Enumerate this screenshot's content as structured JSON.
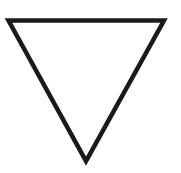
{
  "figure": {
    "shape": "inverted-triangle",
    "fill": "none",
    "stroke_color": "#1a1a1a",
    "stroke_width": 4.5,
    "vertices": {
      "top_left": [
        8.5,
        20.5
      ],
      "top_right": [
        164,
        20.5
      ],
      "bottom": [
        86,
        161
      ]
    }
  }
}
